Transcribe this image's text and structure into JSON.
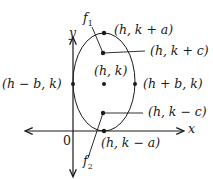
{
  "diagram": {
    "type": "vertical-ellipse",
    "axes": {
      "x_label": "x",
      "y_label": "y",
      "origin_label": "0"
    },
    "foci": {
      "f1_label": "f",
      "f1_sub": "1",
      "f2_label": "f",
      "f2_sub": "2"
    },
    "points": {
      "top_vertex": "(h, k + a)",
      "focus_top": "(h, k + c)",
      "center": "(h, k)",
      "left_covertex": "(h − b, k)",
      "right_covertex": "(h + b, k)",
      "focus_bottom": "(h, k − c)",
      "bottom_vertex": "(h, k − a)"
    },
    "colors": {
      "line": "#1a1a1a",
      "background": "#ffffff"
    }
  }
}
